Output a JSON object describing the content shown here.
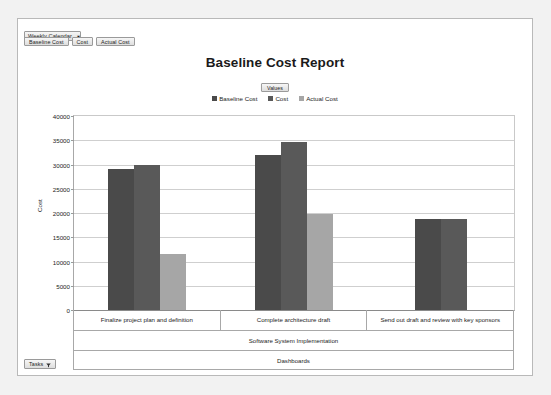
{
  "window": {
    "background_color": "#f2f2f2",
    "card_background": "#ffffff",
    "border_color": "#b9b9b9"
  },
  "slicer": {
    "label": "Weekly Calendar",
    "caret": "▼"
  },
  "field_buttons": [
    {
      "label": "Baseline Cost"
    },
    {
      "label": "Cost"
    },
    {
      "label": "Actual Cost"
    }
  ],
  "values_button": {
    "label": "Values"
  },
  "filter_button": {
    "label": "Tasks",
    "icon": "funnel-icon"
  },
  "colors": {
    "series_baseline_cost": "#4a4a4a",
    "series_cost": "#595959",
    "series_actual_cost": "#a6a6a6",
    "gridline": "#cfcfcf",
    "axis_line": "#8a8a8a",
    "text": "#1c1c1c"
  },
  "chart_data": {
    "type": "bar",
    "title": "Baseline Cost Report",
    "xlabel": "",
    "ylabel": "Cost",
    "ylim": [
      0,
      40000
    ],
    "ytick_step": 5000,
    "yticks": [
      0,
      5000,
      10000,
      15000,
      20000,
      25000,
      30000,
      35000,
      40000
    ],
    "ytick_labels": [
      "0",
      "5000",
      "10000",
      "15000",
      "20000",
      "25000",
      "30000",
      "35000",
      "40000"
    ],
    "grid": true,
    "legend_position": "top",
    "legend_title": "Values",
    "categories": [
      "Finalize project plan and definition",
      "Complete architecture draft",
      "Send out draft and review with key sponsors"
    ],
    "category_group": "Software System Implementation",
    "category_root": "Dashboards",
    "series": [
      {
        "name": "Baseline Cost",
        "color": "#4a4a4a",
        "values": [
          29100,
          32000,
          18700
        ]
      },
      {
        "name": "Cost",
        "color": "#595959",
        "values": [
          30000,
          34600,
          18700
        ]
      },
      {
        "name": "Actual Cost",
        "color": "#a6a6a6",
        "values": [
          11500,
          19800,
          null
        ]
      }
    ]
  }
}
